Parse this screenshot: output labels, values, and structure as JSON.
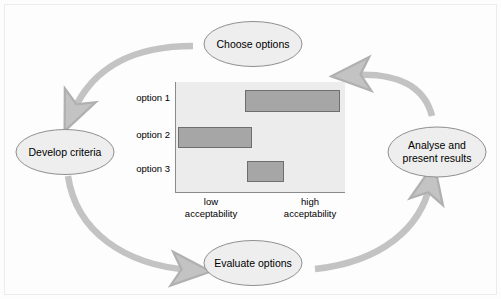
{
  "diagram": {
    "nodes": [
      {
        "id": "choose",
        "label": "Choose options",
        "lines": [
          "Choose options"
        ]
      },
      {
        "id": "develop",
        "label": "Develop criteria",
        "lines": [
          "Develop criteria"
        ]
      },
      {
        "id": "evaluate",
        "label": "Evaluate options",
        "lines": [
          "Evaluate options"
        ]
      },
      {
        "id": "analyse",
        "label": "Analyse and present results",
        "lines": [
          "Analyse and",
          "present results"
        ]
      }
    ],
    "arrows": [
      {
        "from": "choose",
        "to": "develop"
      },
      {
        "from": "develop",
        "to": "evaluate"
      },
      {
        "from": "evaluate",
        "to": "analyse"
      },
      {
        "from": "analyse",
        "to": "choose"
      }
    ],
    "colors": {
      "arrow": "#c3c3c3",
      "node_fill": "#eeeeee",
      "node_stroke": "#8f8f8f",
      "bar_fill": "#a6a6a6",
      "bar_stroke": "#6e6e6e",
      "plot_bg": "#ececed",
      "axis": "#8b8b8b",
      "canvas_bg": "#fdfdfd"
    }
  },
  "chart_data": {
    "type": "bar",
    "orientation": "horizontal",
    "title": "",
    "xlabel": "",
    "ylabel": "",
    "categories": [
      "option 1",
      "option 2",
      "option 3"
    ],
    "axis_low_label": "low\nacceptability",
    "axis_high_label": "high\nacceptability",
    "axis_low_lines": [
      "low",
      "acceptability"
    ],
    "axis_high_lines": [
      "high",
      "acceptability"
    ],
    "xlim": [
      0,
      100
    ],
    "grid": false,
    "legend": "none",
    "ranges": [
      {
        "category": "option 1",
        "start": 41,
        "end": 97
      },
      {
        "category": "option 2",
        "start": 1,
        "end": 45
      },
      {
        "category": "option 3",
        "start": 42,
        "end": 64
      }
    ],
    "values": [
      56,
      44,
      22
    ]
  }
}
